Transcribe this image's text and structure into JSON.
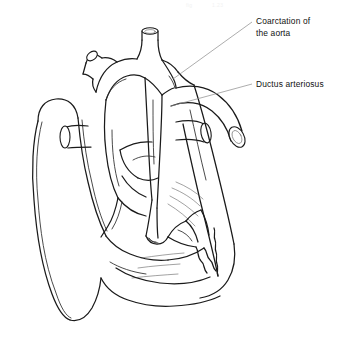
{
  "figure": {
    "title": "Coarctation of the aorta",
    "style": "black-and-white line drawing",
    "background_color": "#ffffff",
    "line_color": "#1a1a1a",
    "leader_line_color": "#8a8a8a",
    "text_color": "#111111",
    "width": 346,
    "height": 343
  },
  "labels": [
    {
      "id": "coarctation",
      "line1": "Coarctation of",
      "line2": "the aorta",
      "text_x": 256,
      "text_y": 24,
      "leader_from_x": 252,
      "leader_from_y": 22,
      "leader_to_x": 173,
      "leader_to_y": 79
    },
    {
      "id": "ductus-arteriosus",
      "line1": "Ductus arteriosus",
      "line2": "",
      "text_x": 256,
      "text_y": 86,
      "leader_from_x": 252,
      "leader_from_y": 84,
      "leader_to_x": 171,
      "leader_to_y": 106
    }
  ],
  "ghost_marks": [
    {
      "text": "fig",
      "x": 186,
      "y": 7
    },
    {
      "text": "1.23",
      "x": 212,
      "y": 7
    }
  ]
}
